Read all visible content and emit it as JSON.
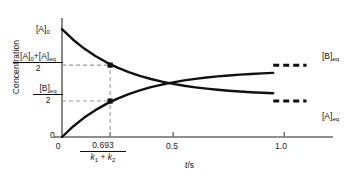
{
  "chart_data": {
    "type": "line",
    "title": "",
    "xlabel": "t/s",
    "ylabel": "Concentration",
    "xlim": [
      0,
      1.12
    ],
    "ylim": [
      0,
      1.0
    ],
    "grid": false,
    "legend": "right-inline-labels",
    "x_ticks": [
      {
        "value": 0,
        "label": "0"
      },
      {
        "value": 0.2165,
        "label": "0.693",
        "label_denominator": "k₁ + k₂"
      },
      {
        "value": 0.5,
        "label": "0.5"
      },
      {
        "value": 1.0,
        "label": "1.0"
      }
    ],
    "y_ticks": [
      {
        "value": 0,
        "label": "0"
      },
      {
        "value": 0.3125,
        "label_numerator": "[B]eq",
        "label_denominator": "2"
      },
      {
        "value": 0.625,
        "label_numerator": "[A]₀+[A]eq",
        "label_denominator": "2"
      },
      {
        "value": 0.9375,
        "label": "[A]₀"
      }
    ],
    "series": [
      {
        "name": "[A]",
        "end_label": "[A]eq",
        "start_value": 0.9375,
        "plateau_value": 0.3125,
        "decays": true,
        "x": [
          0.0,
          0.05,
          0.1,
          0.15,
          0.2,
          0.2165,
          0.25,
          0.3,
          0.35,
          0.4,
          0.45,
          0.5,
          0.55,
          0.6,
          0.65,
          0.7,
          0.75,
          0.8,
          0.85,
          0.9,
          0.95
        ],
        "y": [
          0.9375,
          0.8459,
          0.7688,
          0.7039,
          0.6493,
          0.6338,
          0.6032,
          0.5645,
          0.5319,
          0.5045,
          0.4814,
          0.462,
          0.4456,
          0.4319,
          0.4203,
          0.4105,
          0.4023,
          0.3953,
          0.3895,
          0.3845,
          0.3803
        ]
      },
      {
        "name": "[B]",
        "end_label": "[B]eq",
        "start_value": 0.0,
        "plateau_value": 0.625,
        "decays": false,
        "x": [
          0.0,
          0.05,
          0.1,
          0.15,
          0.2,
          0.2165,
          0.25,
          0.3,
          0.35,
          0.4,
          0.45,
          0.5,
          0.55,
          0.6,
          0.65,
          0.7,
          0.75,
          0.8,
          0.85,
          0.9,
          0.95
        ],
        "y": [
          0.0,
          0.0916,
          0.1687,
          0.2336,
          0.2882,
          0.3037,
          0.3343,
          0.373,
          0.4056,
          0.433,
          0.4561,
          0.4755,
          0.4919,
          0.5056,
          0.5172,
          0.527,
          0.5352,
          0.5422,
          0.548,
          0.553,
          0.5572
        ]
      }
    ],
    "markers": [
      {
        "x": 0.2165,
        "y": 0.625,
        "series": "[A]",
        "shape": "square",
        "note": "half-relaxation point on [A]"
      },
      {
        "x": 0.2165,
        "y": 0.3125,
        "series": "[B]",
        "shape": "square",
        "note": "half-relaxation point on [B]"
      }
    ],
    "guide_lines": [
      {
        "type": "horizontal",
        "y": 0.625,
        "from_x": 0.0,
        "to_x": 0.2165,
        "style": "dashed"
      },
      {
        "type": "horizontal",
        "y": 0.3125,
        "from_x": 0.0,
        "to_x": 0.2165,
        "style": "dashed"
      },
      {
        "type": "vertical",
        "x": 0.2165,
        "from_y": 0.0,
        "to_y": 0.625,
        "style": "dashed"
      },
      {
        "type": "horizontal",
        "y": 0.625,
        "from_x": 0.95,
        "to_x": 1.1,
        "style": "dashed",
        "note": "[B]eq asymptote"
      },
      {
        "type": "horizontal",
        "y": 0.3125,
        "from_x": 0.95,
        "to_x": 1.1,
        "style": "dashed",
        "note": "[A]eq asymptote"
      }
    ],
    "colors": {
      "curve": "#111111",
      "axis": "#6b6b6b",
      "guide": "#9a9a9a",
      "marker": "#111111",
      "background": "#ffffff"
    }
  },
  "axes": {
    "y_title": "Concentration",
    "x_title_italic": "t",
    "x_title_rest": "/s",
    "origin_y_label": "0",
    "origin_x_label": "0"
  },
  "labels": {
    "a_initial": "[A]",
    "a_initial_sub": "0",
    "avg_num_a0": "[A]",
    "avg_num_a0_sub": "0",
    "avg_num_plus": "+[A]",
    "avg_num_aeq_sub": "eq",
    "avg_den": "2",
    "beq_num": "[B]",
    "beq_num_sub": "eq",
    "beq_den": "2",
    "tick_half": "0.693",
    "tick_half_den_k1": "k",
    "tick_half_den_k1_sub": "1",
    "tick_half_den_plus": " + ",
    "tick_half_den_k2": "k",
    "tick_half_den_k2_sub": "2",
    "tick_05": "0.5",
    "tick_10": "1.0",
    "beq_right": "[B]",
    "beq_right_sub": "eq",
    "aeq_right": "[A]",
    "aeq_right_sub": "eq"
  }
}
